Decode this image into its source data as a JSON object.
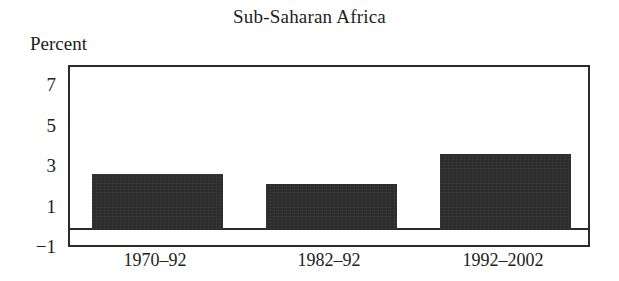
{
  "chart_data": {
    "type": "bar",
    "title": "Sub-Saharan Africa",
    "xlabel": "",
    "ylabel": "Percent",
    "categories": [
      "1970–92",
      "1982–92",
      "1992–2002"
    ],
    "values": [
      2.7,
      2.2,
      3.7
    ],
    "series": [
      {
        "name": "Growth",
        "values": [
          2.7,
          2.2,
          3.7
        ]
      }
    ],
    "ylim": [
      -1,
      8
    ],
    "ytick_labels": [
      "7",
      "5",
      "3",
      "1",
      "−1"
    ],
    "ytick_values": [
      7,
      5,
      3,
      1,
      -1
    ],
    "grid": false,
    "legend": false,
    "legend_position": "none",
    "zero_line": 0,
    "bar_color": "#2c2c2c",
    "axis_color": "#2b2b2b",
    "background_color": "#ffffff"
  },
  "axis": {
    "y_caption": "Percent"
  }
}
